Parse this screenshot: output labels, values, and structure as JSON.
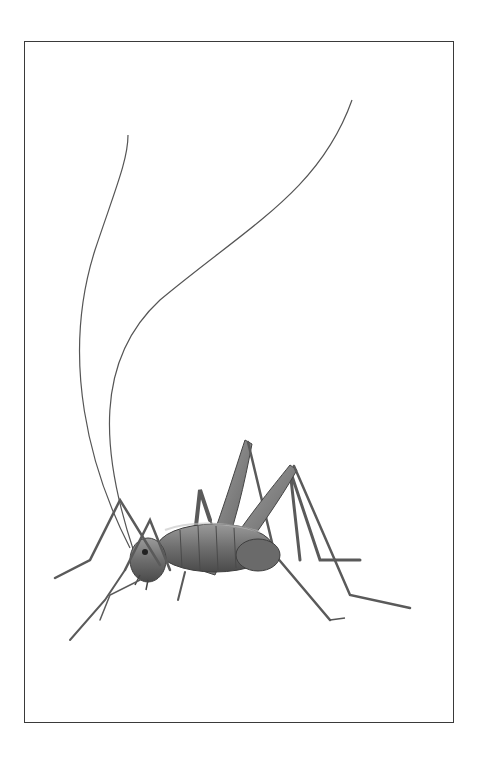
{
  "image": {
    "subject": "cave cricket illustration",
    "background_color": "#ffffff",
    "frame_color": "#3a3a3a",
    "body_color": "#7a7a7a",
    "shadow_color": "#4a4a4a",
    "highlight_color": "#b8b8b8"
  }
}
